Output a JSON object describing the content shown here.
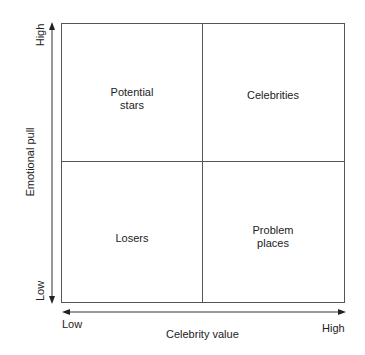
{
  "diagram": {
    "type": "2x2 matrix",
    "x_axis": {
      "title": "Celebrity value",
      "low": "Low",
      "high": "High"
    },
    "y_axis": {
      "title": "Emotional pull",
      "low": "Low",
      "high": "High"
    },
    "quadrants": {
      "top_left": "Potential stars",
      "top_left_lines": [
        "Potential",
        "stars"
      ],
      "top_right": "Celebrities",
      "bottom_left": "Losers",
      "bottom_right": "Problem places",
      "bottom_right_lines": [
        "Problem",
        "places"
      ]
    },
    "colors": {
      "line": "#555555",
      "text": "#222222",
      "background": "#ffffff"
    }
  }
}
